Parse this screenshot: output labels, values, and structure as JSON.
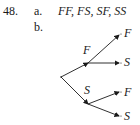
{
  "problem": {
    "number": "48.",
    "part_a": {
      "label": "a.",
      "text": "FF, FS, SF, SS"
    },
    "part_b": {
      "label": "b."
    }
  },
  "tree": {
    "root": {
      "x": 61,
      "y": 77
    },
    "branches": [
      {
        "label": "F",
        "node": {
          "x": 88,
          "y": 63
        },
        "label_pos": {
          "x": 83,
          "y": 43
        },
        "children": [
          {
            "label": "F",
            "end": {
              "x": 119,
              "y": 34
            }
          },
          {
            "label": "S",
            "end": {
              "x": 119,
              "y": 62
            }
          }
        ]
      },
      {
        "label": "S",
        "node": {
          "x": 88,
          "y": 104
        },
        "label_pos": {
          "x": 84,
          "y": 84
        },
        "children": [
          {
            "label": "F",
            "end": {
              "x": 119,
              "y": 92
            }
          },
          {
            "label": "S",
            "end": {
              "x": 119,
              "y": 116
            }
          }
        ]
      }
    ]
  }
}
